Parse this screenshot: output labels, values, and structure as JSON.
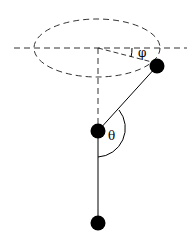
{
  "diagram": {
    "labels": {
      "phi": "φ",
      "theta": "θ"
    },
    "colors": {
      "line": "#000000",
      "dashed": "#333333",
      "mass": "#000000",
      "background": "#ffffff"
    },
    "elements": [
      {
        "id": "horizontal-axis",
        "type": "dashed-line"
      },
      {
        "id": "orbit-ellipse",
        "type": "dashed-ellipse"
      },
      {
        "id": "vertical-axis",
        "type": "dashed-line"
      },
      {
        "id": "radius-to-upper-mass",
        "type": "dashed-line"
      },
      {
        "id": "upper-rod",
        "type": "line"
      },
      {
        "id": "lower-rod",
        "type": "line"
      },
      {
        "id": "upper-mass",
        "type": "circle"
      },
      {
        "id": "middle-mass",
        "type": "circle"
      },
      {
        "id": "bottom-mass",
        "type": "circle"
      },
      {
        "id": "phi-arc",
        "type": "arc",
        "label": "φ"
      },
      {
        "id": "theta-arc",
        "type": "arc",
        "label": "θ"
      }
    ]
  }
}
